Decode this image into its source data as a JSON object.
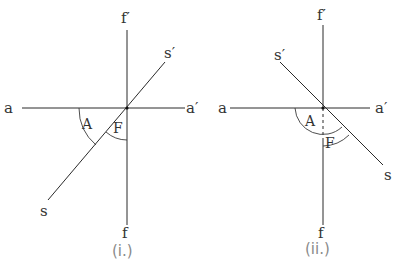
{
  "figures": [
    {
      "id": "i",
      "caption": "(i.)",
      "labels": {
        "a": "a",
        "a_prime": "a′",
        "f": "f",
        "f_prime": "f′",
        "s": "s",
        "s_prime": "s′",
        "angle_A": "A",
        "angle_F": "F"
      }
    },
    {
      "id": "ii",
      "caption": "(ii.)",
      "labels": {
        "a": "a",
        "a_prime": "a′",
        "f": "f",
        "f_prime": "f′",
        "s": "s",
        "s_prime": "s′",
        "angle_A": "A",
        "angle_F": "F"
      }
    }
  ]
}
